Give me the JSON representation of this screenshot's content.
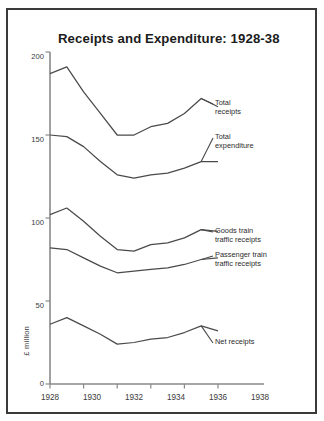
{
  "figure": {
    "title": "Receipts and Expenditure: 1928-38",
    "unit_label": "£ million",
    "border_color": "#3a3a3a",
    "background": "#ffffff",
    "line_color": "#4a4a4a"
  },
  "chart_data": {
    "type": "line",
    "title": "Receipts and Expenditure: 1928-38",
    "xlabel": "",
    "ylabel": "£ million",
    "xlim": [
      1928,
      1938
    ],
    "ylim": [
      0,
      200
    ],
    "grid": false,
    "legend": "direct-labels-right",
    "x": [
      1928,
      1929,
      1930,
      1931,
      1932,
      1933,
      1934,
      1935,
      1936,
      1937,
      1938
    ],
    "xticks": [
      1928,
      1930,
      1932,
      1934,
      1936,
      1938
    ],
    "xtick_labels": [
      "1928",
      "1930",
      "1932",
      "1934",
      "1936",
      "1938"
    ],
    "yticks": [
      0,
      50,
      100,
      150,
      200
    ],
    "ytick_labels": [
      "0",
      "50",
      "100",
      "150",
      "200"
    ],
    "series": [
      {
        "name": "Total receipts",
        "label": "Total\nreceipts",
        "values": [
          187,
          191,
          176,
          163,
          150,
          150,
          155,
          157,
          163,
          172,
          167
        ]
      },
      {
        "name": "Total expenditure",
        "label": "Total\nexpenditure",
        "values": [
          150,
          149,
          143,
          134,
          126,
          124,
          126,
          127,
          130,
          134,
          134
        ]
      },
      {
        "name": "Goods train traffic receipts",
        "label": "Goods train\ntraffic receipts",
        "values": [
          102,
          106,
          98,
          89,
          81,
          80,
          84,
          85,
          88,
          93,
          92
        ]
      },
      {
        "name": "Passenger train traffic receipts",
        "label": "Passenger train\ntraffic receipts",
        "values": [
          82,
          81,
          76,
          71,
          67,
          68,
          69,
          70,
          72,
          75,
          76
        ]
      },
      {
        "name": "Net receipts",
        "label": "Net receipts",
        "values": [
          36,
          40,
          35,
          30,
          24,
          25,
          27,
          28,
          31,
          35,
          32
        ]
      }
    ]
  }
}
